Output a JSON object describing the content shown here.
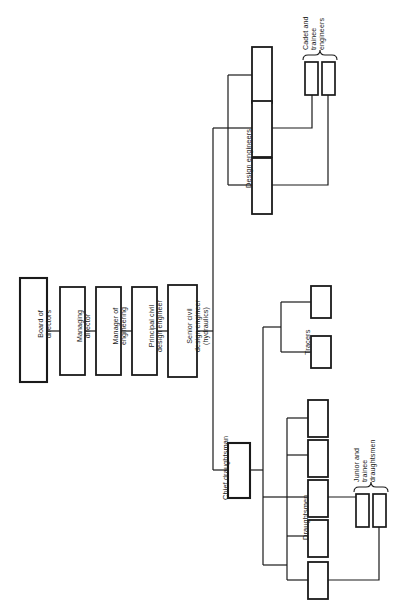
{
  "diagram": {
    "orientation": "rotated-90",
    "line_color": "#1a1a1a",
    "box_fill": "#ffffff",
    "background": "#ffffff"
  },
  "chain": {
    "nodes": [
      {
        "id": "board",
        "label": "Board of\ndirectors"
      },
      {
        "id": "managing",
        "label": "Managing\ndirector"
      },
      {
        "id": "manager_eng",
        "label": "Manager of\nengineering"
      },
      {
        "id": "principal",
        "label": "Principal civil\ndesign engineer"
      },
      {
        "id": "senior_civil",
        "label": "Senior civil\ndesign engineer\n(hydraulics)"
      }
    ]
  },
  "branches": {
    "design": {
      "group_label": "Design engineers",
      "boxes": [
        "",
        "",
        ""
      ],
      "sub": {
        "group_label": "Cadet and\ntrainee\nengineers",
        "boxes": [
          "",
          ""
        ]
      }
    },
    "draughting": {
      "head_label": "Chief draughtsman",
      "tracers": {
        "group_label": "Tracers",
        "boxes": [
          "",
          ""
        ]
      },
      "draughtsmen": {
        "group_label": "Draughtsmen",
        "boxes": [
          "",
          "",
          "",
          "",
          ""
        ]
      },
      "juniors": {
        "group_label": "Junior and\ntrainee\ndraughtsmen",
        "boxes": [
          "",
          ""
        ]
      }
    }
  }
}
